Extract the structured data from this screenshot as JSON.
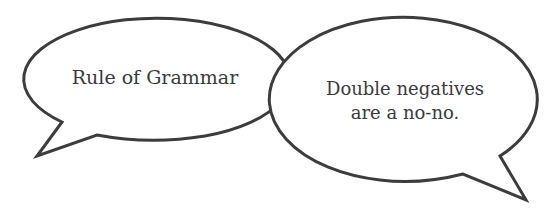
{
  "bubbles": [
    {
      "id": "left",
      "text": "Rule of Grammar"
    },
    {
      "id": "right",
      "line1": "Double negatives",
      "line2": "are a no-no."
    }
  ],
  "colors": {
    "outline": "#3c3c3c",
    "fill": "#ffffff",
    "text": "#3a3a3a",
    "background": "#ffffff"
  }
}
